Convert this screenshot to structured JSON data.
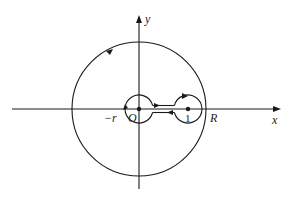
{
  "figure": {
    "type": "contour-integration-diagram"
  },
  "axes": {
    "x_label": "x",
    "y_label": "y",
    "origin_label": "O"
  },
  "labels": {
    "neg_r": "−r",
    "one": "1",
    "R": "R"
  },
  "contours": {
    "outer_circle": {
      "name": "large circle",
      "radius_label": "R",
      "orientation": "counterclockwise"
    },
    "inner_circle_origin": {
      "name": "small circle about O",
      "radius_label": "r",
      "orientation": "clockwise"
    },
    "circle_about_one": {
      "name": "small circle about 1",
      "orientation": "clockwise"
    },
    "corridor": {
      "name": "cut along positive real axis from O to 1"
    }
  },
  "colors": {
    "stroke": "#1a1a1a",
    "background": "#ffffff"
  }
}
